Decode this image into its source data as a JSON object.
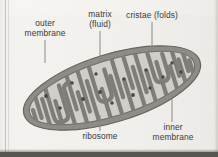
{
  "figure": {
    "style": "grayscale textbook line drawing"
  },
  "labels": {
    "outer_membrane": "outer\nmembrane",
    "matrix": "matrix\n(fluid)",
    "cristae": "cristae (folds)",
    "ribosome": "ribosome",
    "inner_membrane": "inner\nmembrane"
  },
  "colors": {
    "page_background": "#f3f2ef",
    "outer_membrane": "#8d8c86",
    "outer_membrane_edge": "#6d6c66",
    "matrix_fill": "#cfcec8",
    "cristae": "#7e7d77",
    "ribosome": "#4a4944",
    "label_text": "#3b3a36",
    "leader_line": "#8a8984",
    "bottom_edge": "#56554f"
  },
  "diagram": {
    "rotation_deg": -17,
    "body_center": {
      "cx": 112,
      "cy": 88
    },
    "body_radii": {
      "rx": 92,
      "ry": 34
    },
    "membrane_thickness_px": 6,
    "cristae_count": 26,
    "ribosome_count": 14,
    "ribosomes": [
      {
        "x": 46,
        "y": 96
      },
      {
        "x": 60,
        "y": 108
      },
      {
        "x": 72,
        "y": 83
      },
      {
        "x": 83,
        "y": 99
      },
      {
        "x": 96,
        "y": 74
      },
      {
        "x": 100,
        "y": 92
      },
      {
        "x": 112,
        "y": 103
      },
      {
        "x": 124,
        "y": 79
      },
      {
        "x": 133,
        "y": 95
      },
      {
        "x": 146,
        "y": 70
      },
      {
        "x": 150,
        "y": 88
      },
      {
        "x": 163,
        "y": 77
      },
      {
        "x": 172,
        "y": 63
      },
      {
        "x": 181,
        "y": 72
      }
    ]
  },
  "leaders": {
    "outer_membrane": {
      "x1": 45,
      "y1": 40,
      "x2": 45,
      "y2": 62
    },
    "matrix": {
      "x1": 100,
      "y1": 30,
      "x2": 100,
      "y2": 60
    },
    "cristae": {
      "x1": 152,
      "y1": 21,
      "x2": 152,
      "y2": 52
    },
    "ribosome": {
      "x1": 100,
      "y1": 116,
      "x2": 100,
      "y2": 131
    },
    "inner_membrane": {
      "x1": 172,
      "y1": 100,
      "x2": 172,
      "y2": 122
    }
  }
}
